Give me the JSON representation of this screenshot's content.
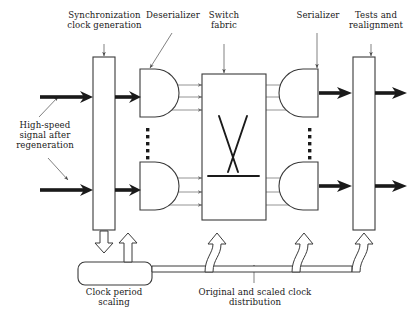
{
  "figure": {
    "type": "block-diagram",
    "background_color": "#ffffff",
    "line_color": "#3a3a3a",
    "thin_line_color": "#7a7a7a",
    "thick_arrow_color": "#1a1a1a",
    "text_color": "#1a1a1a"
  },
  "labels": {
    "sync_clock": "Synchronization\nclock generation",
    "deserializer": "Deserializer",
    "switch_fabric": "Switch\nfabric",
    "serializer": "Serializer",
    "tests": "Tests and\nrealignment",
    "input_signal": "High-speed\nsignal after\nregeneration",
    "clock_period": "Clock period\nscaling",
    "clock_distribution": "Original and scaled clock\ndistribution"
  },
  "blocks": [
    {
      "name": "sync-clock-generation",
      "shape": "rectangle",
      "label_ref": "sync_clock"
    },
    {
      "name": "deserializer-top",
      "shape": "d-shape-right-flat",
      "label_ref": "deserializer"
    },
    {
      "name": "deserializer-bottom",
      "shape": "d-shape-right-flat",
      "label_ref": "deserializer"
    },
    {
      "name": "switch-fabric",
      "shape": "rectangle",
      "label_ref": "switch_fabric"
    },
    {
      "name": "serializer-top",
      "shape": "d-shape-left-flat",
      "label_ref": "serializer"
    },
    {
      "name": "serializer-bottom",
      "shape": "d-shape-left-flat",
      "label_ref": "serializer"
    },
    {
      "name": "tests-and-realignment",
      "shape": "rectangle",
      "label_ref": "tests"
    },
    {
      "name": "clock-period-scaling",
      "shape": "rounded-rectangle",
      "label_ref": "clock_period"
    }
  ],
  "ellipsis": {
    "deserializer_column_dots": 7,
    "serializer_column_dots": 7
  },
  "signal_lanes_per_block": 3,
  "clock_arrow_count": 5
}
